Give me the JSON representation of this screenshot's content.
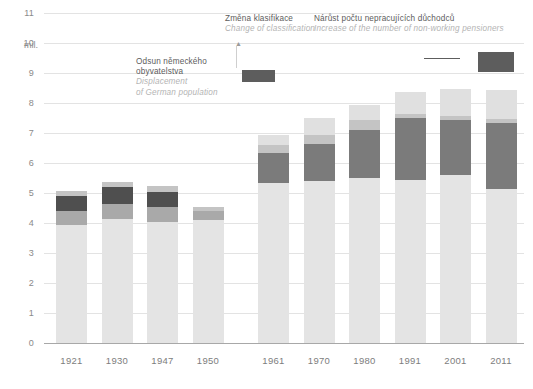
{
  "chart_data": {
    "type": "bar",
    "stacked": true,
    "title": "",
    "subtitle": "",
    "xlabel": "",
    "ylabel": "mil.",
    "ylim": [
      0,
      11
    ],
    "ytick_step": 1,
    "grid": true,
    "legend_position": "none",
    "axis_unit_label": "mil.",
    "categories": [
      "1921",
      "1930",
      "1947",
      "1950",
      "1961",
      "1970",
      "1980",
      "1991",
      "2001",
      "2011"
    ],
    "ytick_labels": [
      "0",
      "1",
      "2",
      "3",
      "4",
      "5",
      "6",
      "7",
      "8",
      "9",
      "10",
      "11"
    ],
    "series": [
      {
        "name": "segment-1-base",
        "color": "#e4e4e4",
        "values": [
          3.95,
          4.15,
          4.05,
          4.1,
          5.35,
          5.4,
          5.5,
          5.45,
          5.6,
          5.15
        ]
      },
      {
        "name": "segment-2-mid-gray",
        "color": "#a9a9a9",
        "values": [
          0.45,
          0.5,
          0.5,
          0.3,
          0.0,
          0.0,
          0.0,
          0.0,
          0.0,
          0.0
        ]
      },
      {
        "name": "segment-3-dark",
        "color": "#4f4f4f",
        "values": [
          0.5,
          0.55,
          0.5,
          0.0,
          0.0,
          0.0,
          0.0,
          0.0,
          0.0,
          0.0
        ]
      },
      {
        "name": "segment-4-pensioners",
        "color": "#7b7b7b",
        "values": [
          0.0,
          0.0,
          0.0,
          0.0,
          1.0,
          1.25,
          1.6,
          2.05,
          1.85,
          2.2
        ]
      },
      {
        "name": "segment-5-light",
        "color": "#c4c4c4",
        "values": [
          0.17,
          0.18,
          0.18,
          0.12,
          0.25,
          0.3,
          0.35,
          0.12,
          0.13,
          0.12
        ]
      },
      {
        "name": "segment-6-top",
        "color": "#e0e0e0",
        "values": [
          0.0,
          0.0,
          0.0,
          0.0,
          0.35,
          0.55,
          0.5,
          0.75,
          0.9,
          0.95
        ]
      }
    ],
    "totals": [
      9.97,
      10.02,
      8.74,
      8.85,
      6.95,
      7.7,
      8.15,
      8.3,
      8.45,
      8.4
    ],
    "annotations": [
      {
        "id": "displacement",
        "cz": "Odsun německého",
        "cz2": "obyvatelstva",
        "en": "Displacement",
        "en2": "of German population"
      },
      {
        "id": "classification",
        "cz": "Změna klasifikace",
        "en": "Change of classification"
      },
      {
        "id": "pensioners",
        "cz": "Nárůst počtu nepracujících důchodců",
        "en": "Increase of the number of non-working pensioners"
      }
    ]
  },
  "colors": {
    "background": "#ffffff",
    "grid": "#e3e3e3",
    "axis": "#a8a8a8",
    "tick_text": "#8a8a8a",
    "xtick_text": "#7d7d7d",
    "anno_cz": "#5c5c5c",
    "anno_en": "#b4b4b4",
    "swatch_dark": "#5d5d5d",
    "leader": "#cfcfcf"
  }
}
